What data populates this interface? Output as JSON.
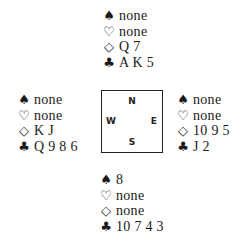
{
  "suits": {
    "spades": "♠",
    "hearts": "♡",
    "diamonds": "◇",
    "clubs": "♣"
  },
  "compass": {
    "north": "N",
    "south": "S",
    "east": "E",
    "west": "W"
  },
  "hands": {
    "north": {
      "spades": "none",
      "hearts": "none",
      "diamonds": "Q 7",
      "clubs": "A K 5"
    },
    "west": {
      "spades": "none",
      "hearts": "none",
      "diamonds": "K J",
      "clubs": "Q 9 8 6"
    },
    "east": {
      "spades": "none",
      "hearts": "none",
      "diamonds": "10 9 5",
      "clubs": "J 2"
    },
    "south": {
      "spades": "8",
      "hearts": "none",
      "diamonds": "none",
      "clubs": "10 7 4 3"
    }
  }
}
